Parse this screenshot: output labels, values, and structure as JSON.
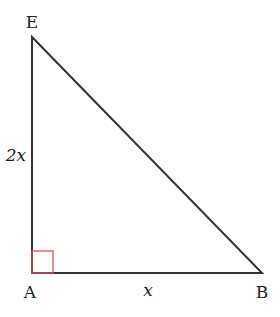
{
  "diagram": {
    "type": "right-triangle",
    "vertices": [
      {
        "id": "E",
        "label": "E"
      },
      {
        "id": "A",
        "label": "A"
      },
      {
        "id": "B",
        "label": "B"
      }
    ],
    "sides": [
      {
        "from": "A",
        "to": "E",
        "label": "2x"
      },
      {
        "from": "A",
        "to": "B",
        "label": "x"
      },
      {
        "from": "E",
        "to": "B",
        "label": ""
      }
    ],
    "right_angle_at": "A",
    "colors": {
      "stroke": "#333333",
      "right_angle_marker": "#d9534f",
      "text": "#222222"
    }
  }
}
